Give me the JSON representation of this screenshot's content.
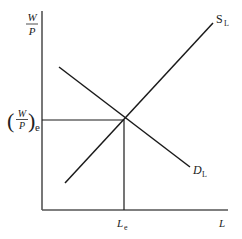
{
  "diagram": {
    "y_axis": {
      "label_numerator": "W",
      "label_denominator": "P"
    },
    "x_axis": {
      "label": "L"
    },
    "equilibrium": {
      "wage_label_numerator": "W",
      "wage_label_denominator": "P",
      "wage_label_subscript": "e",
      "quantity_label": "L",
      "quantity_label_subscript": "e"
    },
    "curves": [
      {
        "name": "supply",
        "label": "S",
        "subscript": "L"
      },
      {
        "name": "demand",
        "label": "D",
        "subscript": "L"
      }
    ],
    "colors": {
      "line": "#1a1a1a",
      "axis": "#555555",
      "background": "#ffffff"
    }
  }
}
